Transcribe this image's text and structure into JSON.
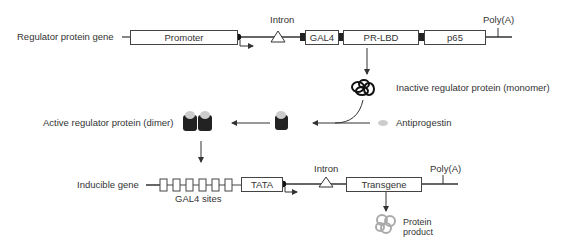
{
  "top_gene": {
    "label": "Regulator protein gene",
    "intron": "Intron",
    "polya": "Poly(A)",
    "segments": [
      "Promoter",
      "GAL4",
      "PR-LBD",
      "p65"
    ]
  },
  "inactive_label": "Inactive regulator protein (monomer)",
  "antiprogestin_label": "Antiprogestin",
  "active_label": "Active regulator protein (dimer)",
  "bottom_gene": {
    "label": "Inducible gene",
    "sites_label": "GAL4 sites",
    "tata": "TATA",
    "intron": "Intron",
    "transgene": "Transgene",
    "polya": "Poly(A)"
  },
  "product_label_line1": "Protein",
  "product_label_line2": "product"
}
